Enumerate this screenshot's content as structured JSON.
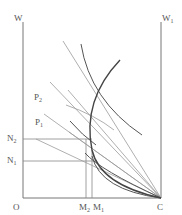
{
  "diagram": {
    "labels": {
      "w_axis": "W",
      "w1_axis": "W",
      "w1_sub": "1",
      "origin": "O",
      "corner": "C",
      "p1": "P",
      "p1_sub": "1",
      "p2": "P",
      "p2_sub": "2",
      "n1": "N",
      "n1_sub": "1",
      "n2": "N",
      "n2_sub": "2",
      "m1": "M",
      "m1_sub": "1",
      "m2": "M",
      "m2_sub": "2"
    },
    "colors": {
      "axis": "#777777",
      "ray": "#9a9a9a",
      "curve": "#555555",
      "contract_curve": "#444444",
      "text": "#555555"
    }
  }
}
